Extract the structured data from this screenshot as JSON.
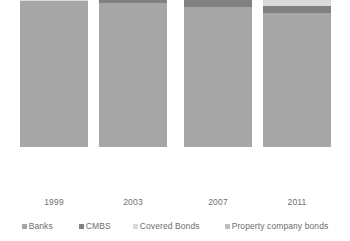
{
  "chart_data": {
    "type": "bar",
    "subtype": "stacked-column-100",
    "title": "",
    "subtitle": "",
    "xlabel": "",
    "ylabel": "",
    "grid": false,
    "legend_position": "bottom",
    "ylim": [
      0,
      100
    ],
    "categories": [
      "1999",
      "2003",
      "2007",
      "2011"
    ],
    "series": [
      {
        "name": "Banks",
        "color": "#a6a6a6",
        "values": [
          83,
          82,
          80,
          76
        ]
      },
      {
        "name": "CMBS",
        "color": "#808080",
        "values": [
          0,
          3,
          6,
          4
        ]
      },
      {
        "name": "Covered Bonds",
        "color": "#d9d9d9",
        "values": [
          17,
          15,
          14,
          20
        ]
      },
      {
        "name": "Property company bonds",
        "color": "#bfbfbf",
        "values": [
          0,
          0,
          0,
          0
        ]
      }
    ]
  },
  "axis": {
    "tick_labels": [
      "1999",
      "2003",
      "2007",
      "2011"
    ]
  },
  "legend": {
    "items": [
      {
        "label": "Banks",
        "color": "#a6a6a6"
      },
      {
        "label": "CMBS",
        "color": "#808080"
      },
      {
        "label": "Covered Bonds",
        "color": "#d9d9d9"
      },
      {
        "label": "Property company bonds",
        "color": "#bfbfbf"
      }
    ]
  },
  "bars": [
    {
      "year": "1999",
      "left": 20,
      "segments": [
        {
          "name": "Covered Bonds",
          "color": "#d9d9d9",
          "height": 30
        },
        {
          "name": "CMBS",
          "color": "#808080",
          "height": 0
        },
        {
          "name": "Banks",
          "color": "#a6a6a6",
          "height": 146
        }
      ]
    },
    {
      "year": "2003",
      "left": 99,
      "segments": [
        {
          "name": "Covered Bonds",
          "color": "#d9d9d9",
          "height": 26
        },
        {
          "name": "CMBS",
          "color": "#808080",
          "height": 6
        },
        {
          "name": "Banks",
          "color": "#a6a6a6",
          "height": 144
        }
      ]
    },
    {
      "year": "2007",
      "left": 184,
      "segments": [
        {
          "name": "Covered Bonds",
          "color": "#d9d9d9",
          "height": 25
        },
        {
          "name": "CMBS",
          "color": "#808080",
          "height": 11
        },
        {
          "name": "Banks",
          "color": "#a6a6a6",
          "height": 140
        }
      ]
    },
    {
      "year": "2011",
      "left": 263,
      "segments": [
        {
          "name": "Covered Bonds",
          "color": "#d9d9d9",
          "height": 35
        },
        {
          "name": "CMBS",
          "color": "#808080",
          "height": 7
        },
        {
          "name": "Banks",
          "color": "#a6a6a6",
          "height": 134
        }
      ]
    }
  ]
}
